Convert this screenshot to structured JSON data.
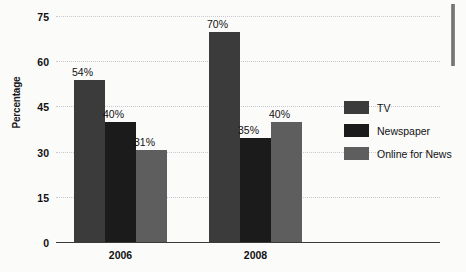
{
  "chart_data": {
    "type": "bar",
    "title": "",
    "xlabel": "",
    "ylabel": "Percentage",
    "categories": [
      "2006",
      "2008"
    ],
    "series": [
      {
        "name": "TV",
        "values": [
          54,
          70
        ],
        "color": "#3b3b3b"
      },
      {
        "name": "Newspaper",
        "values": [
          40,
          35
        ],
        "color": "#1b1b1b"
      },
      {
        "name": "Online for News",
        "values": [
          31,
          40
        ],
        "color": "#5e5e5e"
      }
    ],
    "ylim": [
      0,
      75
    ],
    "yticks": [
      0,
      15,
      30,
      45,
      60,
      75
    ],
    "ytick_labels": [
      "0",
      "15",
      "30",
      "45",
      "60",
      "75"
    ],
    "data_labels": [
      [
        "54%",
        "40%",
        "31%"
      ],
      [
        "70%",
        "35%",
        "40%"
      ]
    ],
    "grid": true,
    "grid_style": "dotted",
    "grid_color": "#c9c9cf",
    "legend_position": "right",
    "axis_line_color": "#3a3a3a",
    "background": "#fbfbfa"
  },
  "legend": {
    "items": [
      {
        "label": "TV"
      },
      {
        "label": "Newspaper"
      },
      {
        "label": "Online for News"
      }
    ]
  },
  "axis": {
    "y_title": "Percentage"
  }
}
